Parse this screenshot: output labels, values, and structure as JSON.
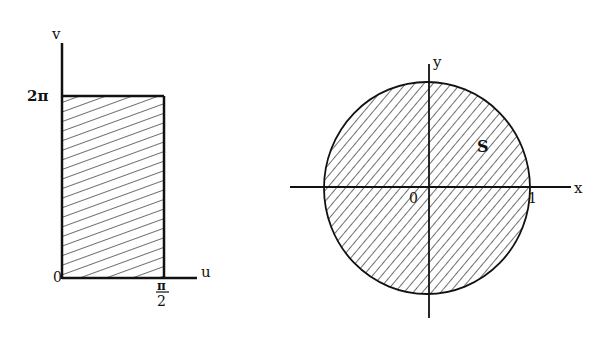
{
  "left_diagram": {
    "axis_x_label": "u",
    "axis_y_label": "v",
    "origin_label": "0",
    "y_tick_label": "2π",
    "x_tick_numerator": "π",
    "x_tick_denominator": "2",
    "region": "rectangle [0, π/2] × [0, 2π]"
  },
  "right_diagram": {
    "axis_x_label": "x",
    "axis_y_label": "y",
    "origin_label": "0",
    "x_tick_label": "1",
    "region_label": "S",
    "region": "unit disk"
  },
  "colors": {
    "ink": "#111111",
    "background": "#ffffff"
  }
}
